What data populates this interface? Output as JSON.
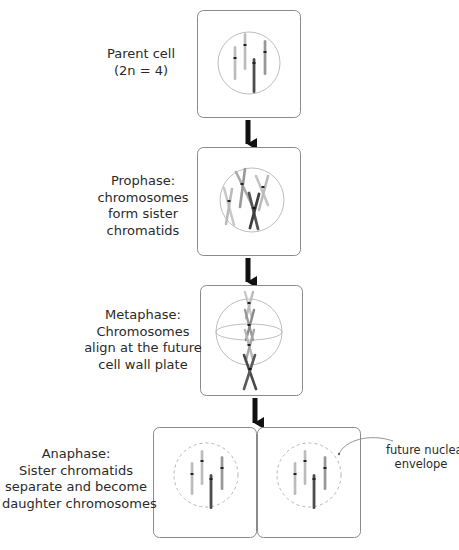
{
  "stages": [
    {
      "id": "parent",
      "lines": [
        "Parent cell",
        "(2n = 4)"
      ]
    },
    {
      "id": "prophase",
      "lines": [
        "Prophase:",
        "chromosomes",
        "form sister",
        "chromatids"
      ]
    },
    {
      "id": "metaphase",
      "lines": [
        "Metaphase:",
        "Chromosomes",
        "align at the future",
        "cell wall plate"
      ]
    },
    {
      "id": "anaphase",
      "lines": [
        "Anaphase:",
        "Sister chromatids",
        "separate and become",
        "daughter chromosomes"
      ]
    }
  ],
  "annotation": {
    "lines": [
      "future nuclear",
      "envelope"
    ]
  },
  "colors": {
    "box_border": "#8a8a8a",
    "circle": "#b5b5b5",
    "arrow": "#111111",
    "chromosome_light": "#bdbdbd",
    "chromosome_medium": "#9a9a9a",
    "chromosome_dark": "#4a4a4a",
    "centromere": "#222222"
  }
}
